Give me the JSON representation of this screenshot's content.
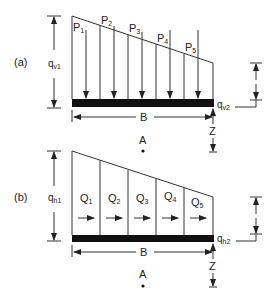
{
  "diagram_a": {
    "label": "(a)",
    "left_magnitude": "q",
    "left_magnitude_sub": "v1",
    "right_magnitude": "q",
    "right_magnitude_sub": "v2",
    "width_label": "B",
    "depth_label": "Z",
    "point_label": "A",
    "loads": [
      {
        "name": "P",
        "sub": "1"
      },
      {
        "name": "P",
        "sub": "2"
      },
      {
        "name": "P",
        "sub": "3"
      },
      {
        "name": "P",
        "sub": "4"
      },
      {
        "name": "P",
        "sub": "5"
      }
    ]
  },
  "diagram_b": {
    "label": "(b)",
    "left_magnitude": "q",
    "left_magnitude_sub": "h1",
    "right_magnitude": "q",
    "right_magnitude_sub": "h2",
    "width_label": "B",
    "depth_label": "Z",
    "point_label": "A",
    "loads": [
      {
        "name": "Q",
        "sub": "1"
      },
      {
        "name": "Q",
        "sub": "2"
      },
      {
        "name": "Q",
        "sub": "3"
      },
      {
        "name": "Q",
        "sub": "4"
      },
      {
        "name": "Q",
        "sub": "5"
      }
    ]
  }
}
